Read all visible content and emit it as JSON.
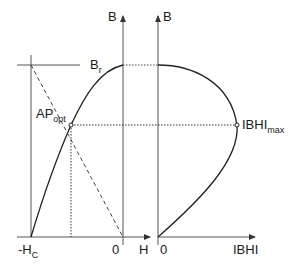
{
  "diagram": {
    "title": "",
    "colors": {
      "line": "#2a2a2a",
      "axis": "#555555"
    },
    "left_plot": {
      "y_axis_label": "B",
      "x_axis_label": "H",
      "origin_label": "0",
      "remanence_label": {
        "main": "B",
        "sub": "r"
      },
      "coercivity_label": {
        "main": "-H",
        "sub": "C"
      },
      "operating_point_label": {
        "main": "AP",
        "sub": "opt"
      }
    },
    "right_plot": {
      "y_axis_label": "B",
      "x_axis_label": "IBHI",
      "origin_label": "0",
      "max_label": {
        "main": "IBHI",
        "sub": "max"
      }
    }
  }
}
